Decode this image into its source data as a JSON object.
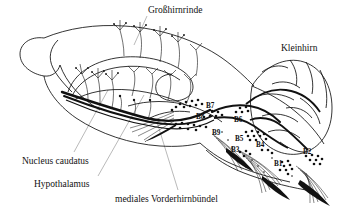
{
  "figure": {
    "background_color": "#ffffff",
    "ink_color": "#111111",
    "leader_line_color": "#8a8a8a",
    "width": 338,
    "height": 212
  },
  "anatomy_labels": [
    {
      "id": "grosshirnrinde",
      "text": "Großhirnrinde",
      "x": 148,
      "y": 6,
      "class": "anat"
    },
    {
      "id": "kleinhirn",
      "text": "Kleinhirn",
      "x": 281,
      "y": 44,
      "class": "region"
    },
    {
      "id": "nucleus-caudatus",
      "text": "Nucleus caudatus",
      "x": 22,
      "y": 157,
      "class": "anat"
    },
    {
      "id": "hypothalamus",
      "text": "Hypothalamus",
      "x": 34,
      "y": 180,
      "class": "anat"
    },
    {
      "id": "mediales-vorderhirnbuendel",
      "text": "mediales Vorderhirnbündel",
      "x": 115,
      "y": 195,
      "class": "anat"
    }
  ],
  "nuclei_labels": [
    {
      "id": "B7",
      "text": "B7",
      "x": 206,
      "y": 103
    },
    {
      "id": "B8",
      "text": "B8",
      "x": 196,
      "y": 114
    },
    {
      "id": "B6",
      "text": "B6",
      "x": 234,
      "y": 117
    },
    {
      "id": "B9",
      "text": "B9",
      "x": 212,
      "y": 130
    },
    {
      "id": "B5",
      "text": "B5",
      "x": 235,
      "y": 136
    },
    {
      "id": "B4",
      "text": "B4",
      "x": 256,
      "y": 142
    },
    {
      "id": "B3",
      "text": "B3",
      "x": 231,
      "y": 147
    },
    {
      "id": "B2",
      "text": "B2",
      "x": 303,
      "y": 149
    },
    {
      "id": "B1",
      "text": "B1",
      "x": 274,
      "y": 161
    }
  ],
  "legend_note": {
    "nuclei_series": "B1-B9",
    "description": "Raphe-Kerngruppen B1 bis B9 mit aufsteigenden und absteigenden Projektionen"
  }
}
